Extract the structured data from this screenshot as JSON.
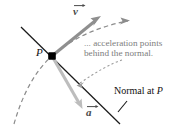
{
  "figure": {
    "background": "#ffffff",
    "width": 184,
    "height": 128
  },
  "labels": {
    "point": "P",
    "velocity_vector": "v",
    "acceleration_vector": "a",
    "annotation_line1": "... acceleration points",
    "annotation_line2": "behind the normal.",
    "normal_line1": "Normal at ",
    "normal_point": "P"
  },
  "colors": {
    "curve": "#8c8c8c",
    "normal_line": "#1a1a1a",
    "velocity_arrow": "#8f8f8f",
    "acceleration_arrow": "#b9b9b9",
    "point_dot": "#000000",
    "annotation_text": "#7d7d7d",
    "label_text": "#111111",
    "leader": "#9a9a9a"
  },
  "geometry": {
    "point_P": [
      52,
      56
    ],
    "velocity_tip": [
      100,
      16
    ],
    "acceleration_tip": [
      82,
      108
    ],
    "normal_start": [
      21,
      27
    ],
    "normal_end": [
      120,
      124
    ],
    "trajectory_start": [
      14,
      124
    ],
    "trajectory_end": [
      130,
      20
    ]
  }
}
